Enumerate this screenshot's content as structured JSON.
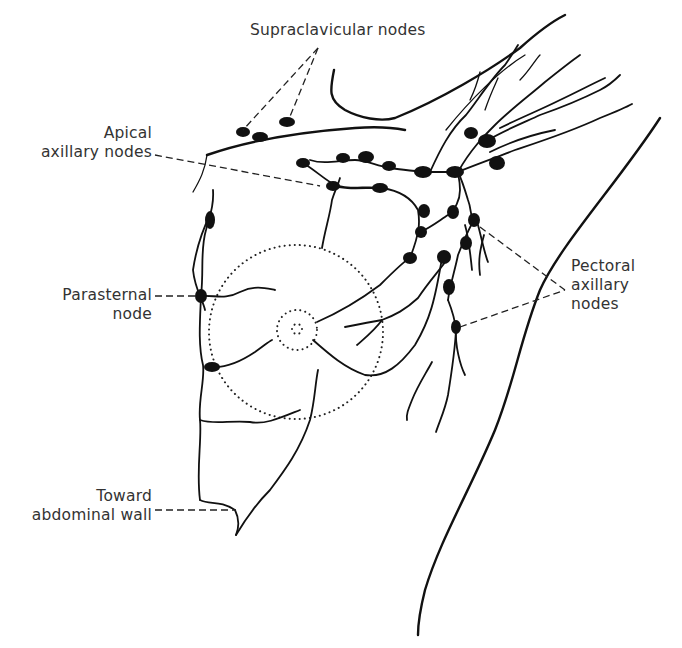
{
  "diagram": {
    "colors": {
      "line": "#111111",
      "label_text": "#333333",
      "background": "#ffffff"
    },
    "labels": {
      "supraclavicular": {
        "lines": [
          "Supraclavicular nodes"
        ]
      },
      "apical": {
        "lines": [
          "Apical",
          "axillary nodes"
        ]
      },
      "parasternal": {
        "lines": [
          "Parasternal",
          "node"
        ]
      },
      "pectoral": {
        "lines": [
          "Pectoral",
          "axillary",
          "nodes"
        ]
      },
      "abdominal": {
        "lines": [
          "Toward",
          "abdominal wall"
        ]
      }
    },
    "structures": [
      "clavicle-outline",
      "shoulder-arm-outline",
      "trunk-lateral-outline",
      "breast-dotted-outline",
      "areola-dotted-outline",
      "nipple-dotted-outline",
      "lymphatic-vessels",
      "lymph-nodes"
    ]
  }
}
